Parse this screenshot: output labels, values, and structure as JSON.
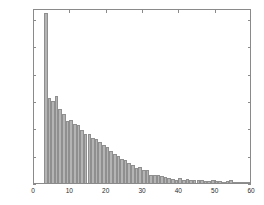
{
  "figure": {
    "background_color": "#ffffff",
    "axis_color": "#8a8a8a",
    "bar_fill_color": "#b4b4b4",
    "bar_edge_color": "#8f8f8f",
    "text_color": "#2b2b2b"
  },
  "chart_data": {
    "type": "bar",
    "title": "",
    "subtitle": "",
    "xlabel": "",
    "ylabel": "",
    "xlim": [
      0,
      60
    ],
    "ylim": [
      0,
      1280
    ],
    "xticks": [
      0,
      10,
      20,
      30,
      40,
      50,
      60
    ],
    "yticks": [
      0,
      200,
      400,
      600,
      800,
      1000,
      1200
    ],
    "xtick_labels": [
      "0",
      "10",
      "20",
      "30",
      "40",
      "50",
      "60"
    ],
    "ytick_labels": [
      "0",
      "200",
      "400",
      "600",
      "800",
      "1000",
      "1200"
    ],
    "grid": false,
    "legend": null,
    "legend_position": "none",
    "bar_width": 1,
    "categories": [
      3,
      4,
      5,
      6,
      7,
      8,
      9,
      10,
      11,
      12,
      13,
      14,
      15,
      16,
      17,
      18,
      19,
      20,
      21,
      22,
      23,
      24,
      25,
      26,
      27,
      28,
      29,
      30,
      31,
      32,
      33,
      34,
      35,
      36,
      37,
      38,
      39,
      40,
      41,
      42,
      43,
      44,
      45,
      46,
      47,
      48,
      49,
      50,
      51,
      52,
      53,
      54,
      55,
      56,
      57,
      58,
      59
    ],
    "values": [
      1245,
      625,
      600,
      635,
      545,
      505,
      455,
      460,
      430,
      425,
      385,
      360,
      355,
      330,
      320,
      300,
      280,
      265,
      235,
      210,
      195,
      175,
      165,
      150,
      135,
      110,
      120,
      95,
      95,
      60,
      55,
      55,
      50,
      45,
      40,
      30,
      25,
      35,
      25,
      30,
      20,
      25,
      20,
      20,
      15,
      12,
      20,
      15,
      12,
      10,
      15,
      20,
      10,
      8,
      6,
      5,
      5
    ]
  }
}
